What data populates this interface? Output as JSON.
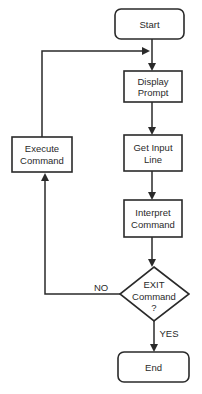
{
  "diagram": {
    "type": "flowchart",
    "nodes": [
      {
        "id": "start",
        "shape": "terminal",
        "lines": [
          "Start"
        ]
      },
      {
        "id": "display",
        "shape": "process",
        "lines": [
          "Display",
          "Prompt"
        ]
      },
      {
        "id": "getinput",
        "shape": "process",
        "lines": [
          "Get Input",
          "Line"
        ]
      },
      {
        "id": "interpret",
        "shape": "process",
        "lines": [
          "Interpret",
          "Command"
        ]
      },
      {
        "id": "exit",
        "shape": "decision",
        "lines": [
          "EXIT",
          "Command",
          "?"
        ]
      },
      {
        "id": "end",
        "shape": "terminal",
        "lines": [
          "End"
        ]
      },
      {
        "id": "execute",
        "shape": "process",
        "lines": [
          "Execute",
          "Command"
        ]
      }
    ],
    "edges": [
      {
        "from": "start",
        "to": "display",
        "label": ""
      },
      {
        "from": "display",
        "to": "getinput",
        "label": ""
      },
      {
        "from": "getinput",
        "to": "interpret",
        "label": ""
      },
      {
        "from": "interpret",
        "to": "exit",
        "label": ""
      },
      {
        "from": "exit",
        "to": "end",
        "label": "YES"
      },
      {
        "from": "exit",
        "to": "execute",
        "label": "NO"
      },
      {
        "from": "execute",
        "to": "display",
        "label": ""
      }
    ],
    "edge_labels": {
      "yes": "YES",
      "no": "NO"
    }
  }
}
